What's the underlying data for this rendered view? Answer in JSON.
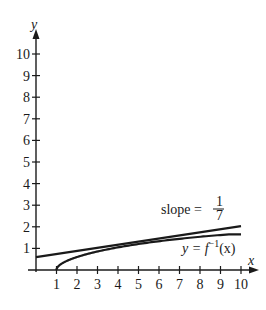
{
  "figure": {
    "type": "function graph",
    "axes": {
      "x_label": "x",
      "y_label": "y",
      "x_ticks": [
        "1",
        "2",
        "3",
        "4",
        "5",
        "6",
        "7",
        "8",
        "9",
        "10"
      ],
      "y_ticks": [
        "1",
        "2",
        "3",
        "4",
        "5",
        "6",
        "7",
        "8",
        "9",
        "10"
      ],
      "xlim": [
        0,
        10
      ],
      "ylim": [
        0,
        10
      ]
    },
    "annotations": {
      "slope_text": "slope =",
      "slope_num": "1",
      "slope_den": "7",
      "curve_label_prefix": "y = f",
      "curve_label_sup": "−1",
      "curve_label_suffix": "(x)"
    },
    "curves": [
      {
        "name": "tangent line",
        "equation": "y = x/7 + 0.6",
        "color": "#1a1a1a"
      },
      {
        "name": "y = f^-1(x)",
        "start": [
          1,
          0
        ],
        "color": "#1a1a1a"
      }
    ]
  }
}
